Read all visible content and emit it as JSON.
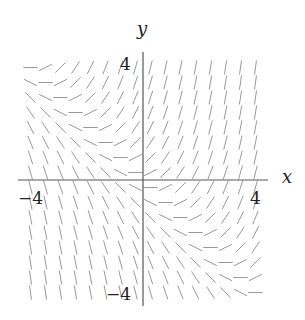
{
  "diagram": {
    "type": "slope_field",
    "equation": "dy/dx = x + y",
    "axes": {
      "x_label": "x",
      "y_label": "y",
      "x_ticks": [
        {
          "value": -4,
          "label": "−4"
        },
        {
          "value": 4,
          "label": "4"
        }
      ],
      "y_ticks": [
        {
          "value": 4,
          "label": "4"
        },
        {
          "value": -4,
          "label": "−4"
        }
      ],
      "x_range": [
        -4.2,
        4.2
      ],
      "y_range": [
        -4.2,
        4.3
      ]
    },
    "grid": {
      "x_values": [
        -3.75,
        -3.25,
        -2.75,
        -2.25,
        -1.75,
        -1.25,
        -0.75,
        -0.25,
        0.25,
        0.75,
        1.25,
        1.75,
        2.25,
        2.75,
        3.25,
        3.75
      ],
      "y_values": [
        3.75,
        3.25,
        2.75,
        2.25,
        1.75,
        1.25,
        0.75,
        0.25,
        -0.25,
        -0.75,
        -1.25,
        -1.75,
        -2.25,
        -2.75,
        -3.25,
        -3.75
      ],
      "segment_length_units": 0.3
    },
    "colors": {
      "axis": "#555555",
      "segment": "#999999",
      "text": "#222222"
    }
  }
}
